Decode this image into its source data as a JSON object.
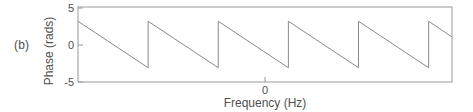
{
  "figure": {
    "panel_label": "(b)"
  },
  "chart_data": {
    "type": "line",
    "title": "",
    "xlabel": "Frequency (Hz)",
    "ylabel": "Phase (rads)",
    "xlim": [
      -2.4,
      2.4
    ],
    "ylim": [
      -5,
      5
    ],
    "grid": false,
    "legend": null,
    "line_color": "#8a8a8a",
    "frame_color": "#9a9a9a",
    "y_ticks": [
      {
        "value": 5,
        "label": "5"
      },
      {
        "value": 0,
        "label": "0"
      },
      {
        "value": -5,
        "label": "-5"
      }
    ],
    "x_ticks": [
      {
        "value": 0,
        "label": "0"
      }
    ],
    "wrap_limits": [
      -3.1,
      3.1
    ],
    "series": [
      {
        "name": "wrapped phase",
        "x": [
          -2.4,
          -1.5,
          -1.5,
          -0.6,
          -0.6,
          0.3,
          0.3,
          1.2,
          1.2,
          2.1,
          2.1,
          2.4
        ],
        "y": [
          3.1,
          -3.1,
          3.1,
          -3.1,
          3.1,
          -3.1,
          3.1,
          -3.1,
          3.1,
          -3.1,
          3.1,
          2.0
        ]
      }
    ],
    "segments": [
      {
        "x0": -2.4,
        "y0": 3.1,
        "x1": -1.5,
        "y1": -3.1
      },
      {
        "x0": -1.5,
        "y0": 3.1,
        "x1": -0.6,
        "y1": -3.1
      },
      {
        "x0": -0.6,
        "y0": 3.1,
        "x1": 0.3,
        "y1": -3.1
      },
      {
        "x0": 0.3,
        "y0": 3.1,
        "x1": 1.2,
        "y1": -3.1
      },
      {
        "x0": 1.2,
        "y0": 3.1,
        "x1": 2.1,
        "y1": -3.1
      },
      {
        "x0": 2.1,
        "y0": 3.1,
        "x1": 2.4,
        "y1": 1.0
      }
    ],
    "jump_count": 5,
    "slope_sign": "negative"
  }
}
